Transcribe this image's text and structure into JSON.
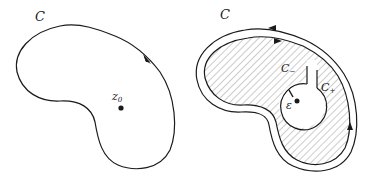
{
  "left_panel": {
    "contour_label": "C",
    "point_label": "z",
    "point_subscript": "0"
  },
  "right_panel": {
    "contour_label": "C",
    "cut_minus_label": "C",
    "cut_minus_subscript": "−",
    "cut_plus_label": "C",
    "cut_plus_subscript": "+",
    "radius_label": "ε"
  },
  "colors": {
    "stroke": "#1a1a1a",
    "hatch": "#9a9a9a",
    "background": "#ffffff"
  }
}
